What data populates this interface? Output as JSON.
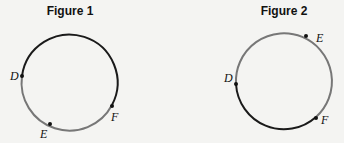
{
  "figures": [
    {
      "title": "Figure 1",
      "points": {
        "D": "D",
        "E": "E",
        "F": "F"
      },
      "arcs": {
        "black": "D-top-F",
        "gray": "D-E-F"
      }
    },
    {
      "title": "Figure 2",
      "points": {
        "D": "D",
        "E": "E",
        "F": "F"
      },
      "arcs": {
        "gray": "D-E-F",
        "black": "D-bottom-F"
      }
    }
  ],
  "colors": {
    "dark_arc": "#1a1a1a",
    "gray_arc": "#777777",
    "background": "#f4f4f2"
  }
}
